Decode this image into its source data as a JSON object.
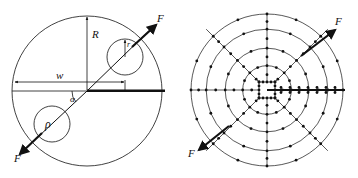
{
  "left_figure": {
    "labels": {
      "radius_outer": "R",
      "radius_inner": "r",
      "rho": "ρ",
      "width": "w",
      "angle": "α",
      "force_top": "F",
      "force_bottom": "F"
    }
  },
  "right_figure": {
    "labels": {
      "force_top": "F",
      "force_bottom": "F"
    },
    "mesh": {
      "rings": 4,
      "radial_directions": 8
    }
  },
  "colors": {
    "stroke": "#111111",
    "background": "#ffffff"
  }
}
